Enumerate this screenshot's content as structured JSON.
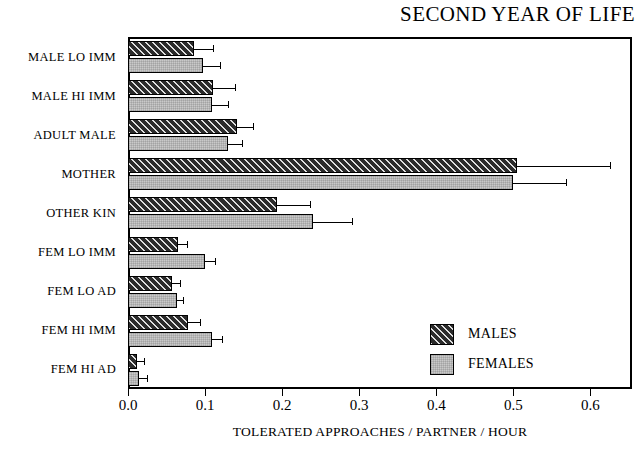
{
  "chart_data": {
    "type": "bar",
    "orientation": "horizontal",
    "title": "SECOND YEAR OF LIFE",
    "xlabel": "TOLERATED APPROACHES / PARTNER / HOUR",
    "ylabel": "",
    "xlim": [
      0.0,
      0.654
    ],
    "xticks": [
      0.0,
      0.1,
      0.2,
      0.3,
      0.4,
      0.5,
      0.6
    ],
    "xticklabels": [
      "0.0",
      "0.1",
      "0.2",
      "0.3",
      "0.4",
      "0.5",
      "0.6"
    ],
    "grid": false,
    "legend_position": "inside-lower-right",
    "categories": [
      "MALE LO IMM",
      "MALE HI IMM",
      "ADULT MALE",
      "MOTHER",
      "OTHER KIN",
      "FEM LO IMM",
      "FEM LO AD",
      "FEM HI IMM",
      "FEM HI AD"
    ],
    "series": [
      {
        "name": "MALES",
        "fill": "dark-hatched",
        "color": "#2b2b2b",
        "values": [
          0.086,
          0.11,
          0.141,
          0.505,
          0.193,
          0.065,
          0.057,
          0.078,
          0.012
        ],
        "errors": [
          0.024,
          0.029,
          0.021,
          0.121,
          0.043,
          0.012,
          0.011,
          0.016,
          0.009
        ]
      },
      {
        "name": "FEMALES",
        "fill": "light-gray",
        "color": "#c9c9c9",
        "values": [
          0.097,
          0.109,
          0.13,
          0.499,
          0.24,
          0.1,
          0.064,
          0.109,
          0.014
        ],
        "errors": [
          0.023,
          0.021,
          0.018,
          0.069,
          0.051,
          0.013,
          0.007,
          0.013,
          0.011
        ]
      }
    ]
  },
  "legend": {
    "entries": [
      {
        "label": "MALES"
      },
      {
        "label": "FEMALES"
      }
    ]
  }
}
